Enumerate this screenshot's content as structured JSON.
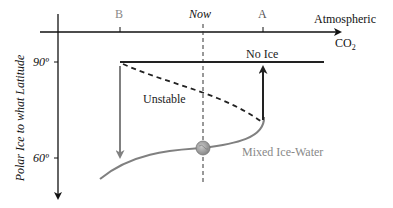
{
  "diagram": {
    "x_axis": {
      "label_line1": "Atmospheric",
      "label_line2": "CO",
      "label_sub": "2",
      "ticks": [
        {
          "label": "B",
          "x": 120
        },
        {
          "label": "Now",
          "x": 203
        },
        {
          "label": "A",
          "x": 263
        }
      ]
    },
    "y_axis": {
      "label": "Polar Ice to what Latitude",
      "ticks": [
        {
          "label": "90º",
          "y": 62
        },
        {
          "label": "60º",
          "y": 158
        }
      ]
    },
    "branches": {
      "no_ice": "No Ice",
      "unstable": "Unstable",
      "mixed": "Mixed Ice-Water"
    },
    "colors": {
      "axis": "#111111",
      "gray_branch": "#808080",
      "dashed": "#222222",
      "globe": "#9a9a9a"
    }
  }
}
